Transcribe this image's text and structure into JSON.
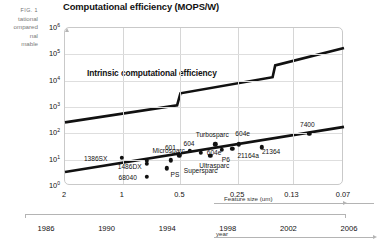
{
  "figure": {
    "fig_number": "FIG. 1",
    "caption_lines": [
      "tational",
      "ompared",
      "nal",
      "mable"
    ]
  },
  "chart_data": {
    "type": "scatter",
    "title": "Computational efficiency (MOPS/W)",
    "xlabel": "Feature size (um)",
    "ylabel": "",
    "secondary_xlabel": "year",
    "annotation": "Intrinsic computational efficiency",
    "grid": true,
    "legend": "none",
    "x_axis": {
      "scale": "log-reversed",
      "ticks": [
        "2",
        "1",
        "0.5",
        "0.25",
        "0.13",
        "0.07"
      ],
      "values": [
        2,
        1,
        0.5,
        0.25,
        0.13,
        0.07
      ]
    },
    "x_axis_secondary": {
      "ticks": [
        "1986",
        "1990",
        "1994",
        "1998",
        "2002",
        "2006"
      ],
      "values": [
        1986,
        1990,
        1994,
        1998,
        2002,
        2006
      ]
    },
    "y_axis": {
      "scale": "log",
      "ticks": [
        "10⁰",
        "10¹",
        "10²",
        "10³",
        "10⁴",
        "10⁵",
        "10⁶"
      ],
      "exponents": [
        0,
        1,
        2,
        3,
        4,
        5,
        6
      ],
      "ylim": [
        1,
        1000000
      ]
    },
    "series": [
      {
        "name": "Intrinsic computational efficiency",
        "type": "step-line",
        "points": [
          {
            "x": 2.0,
            "y": 260
          },
          {
            "x": 0.52,
            "y": 1150
          },
          {
            "x": 0.5,
            "y": 3300
          },
          {
            "x": 0.165,
            "y": 13500
          },
          {
            "x": 0.16,
            "y": 38000
          },
          {
            "x": 0.07,
            "y": 175000
          }
        ]
      },
      {
        "name": "Delivered computational efficiency",
        "type": "line",
        "points": [
          {
            "x": 2.0,
            "y": 3.4
          },
          {
            "x": 0.07,
            "y": 175
          }
        ]
      }
    ],
    "data_points": [
      {
        "label": "1386SX",
        "x": 1.0,
        "y": 10.5,
        "label_dx": -26,
        "label_dy": 0
      },
      {
        "label": "1486DX",
        "x": 0.74,
        "y": 6.3,
        "label_dx": -17,
        "label_dy": 2
      },
      {
        "label": "68040",
        "x": 0.74,
        "y": 2.1,
        "label_dx": -19,
        "label_dy": 0
      },
      {
        "label": "Microsparc",
        "x": 0.74,
        "y": 8.1,
        "label_dx": 22,
        "label_dy": -11
      },
      {
        "label": "PS",
        "x": 0.58,
        "y": 4.3,
        "label_dx": 8,
        "label_dy": 6
      },
      {
        "label": "Supersparc",
        "x": 0.555,
        "y": 8.6,
        "label_dx": 30,
        "label_dy": 10
      },
      {
        "label": "601",
        "x": 0.5,
        "y": 13.5,
        "label_dx": -9,
        "label_dy": -8
      },
      {
        "label": "604",
        "x": 0.44,
        "y": 19.5,
        "label_dx": -1,
        "label_dy": -8
      },
      {
        "label": "604e",
        "x": 0.385,
        "y": 16.5,
        "label_dx": 13,
        "label_dy": -1
      },
      {
        "label": "Ultrasparc",
        "x": 0.345,
        "y": 12.5,
        "label_dx": 4,
        "label_dy": 9
      },
      {
        "label": "Turbosparc",
        "x": 0.325,
        "y": 35.0,
        "label_dx": -3,
        "label_dy": -10
      },
      {
        "label": "P6",
        "x": 0.3,
        "y": 22.0,
        "label_dx": 4,
        "label_dy": 9
      },
      {
        "label": "21164a",
        "x": 0.265,
        "y": 23.5,
        "label_dx": 16,
        "label_dy": 6
      },
      {
        "label": "604e ",
        "x": 0.245,
        "y": 35.0,
        "label_dx": 4,
        "label_dy": -11
      },
      {
        "label": "21364",
        "x": 0.185,
        "y": 27.0,
        "label_dx": 9,
        "label_dy": 4
      },
      {
        "label": "7400",
        "x": 0.105,
        "y": 88.0,
        "label_dx": -2,
        "label_dy": -10
      }
    ]
  }
}
